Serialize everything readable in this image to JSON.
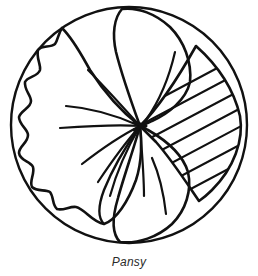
{
  "figure": {
    "caption": "Pansy",
    "style": "black-ink-line-art-on-white",
    "colors": {
      "ink": "#111111",
      "background": "#ffffff",
      "caption_text": "#2b2b2b"
    },
    "frame": {
      "shape": "circle",
      "center_x": 129,
      "center_y": 125,
      "radius": 118,
      "stroke_width": 2.4
    },
    "flower_center": {
      "x": 140,
      "y": 126,
      "label": "petal-convergence-point"
    },
    "petals": [
      {
        "id": "left-petal",
        "name": "large-scalloped-left-petal",
        "edge": "wavy-scalloped",
        "fill": "none",
        "veins": 6
      },
      {
        "id": "top-petal",
        "name": "upper-petal",
        "edge": "smooth",
        "fill": "none",
        "veins": 1
      },
      {
        "id": "right-petal",
        "name": "hatched-right-petal",
        "edge": "smooth",
        "fill": "diagonal-hatching",
        "hatch_line_count": 12,
        "hatch_angle_deg": 28
      },
      {
        "id": "bottom-petal",
        "name": "lower-petal",
        "edge": "smooth",
        "fill": "none",
        "veins": 1
      },
      {
        "id": "lower-left-petal",
        "name": "lower-left-petal",
        "edge": "smooth",
        "fill": "none",
        "veins": 1
      }
    ]
  }
}
